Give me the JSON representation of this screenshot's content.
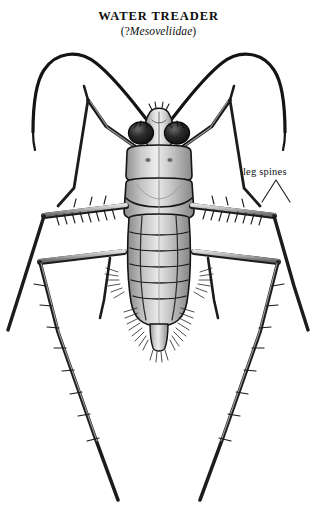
{
  "figure": {
    "title": "WATER TREADER",
    "subtitle_open": "(",
    "subtitle_query": "?",
    "subtitle_family": "Mesoveliidae",
    "subtitle_close": ")",
    "annotation_label": "leg spines",
    "background_color": "#ffffff",
    "ink_color": "#111111",
    "body_fill_light": "#d8d8d8",
    "body_fill_mid": "#a9a9a9",
    "body_fill_dark": "#6f6f6f",
    "eye_color": "#1a1a1a"
  }
}
